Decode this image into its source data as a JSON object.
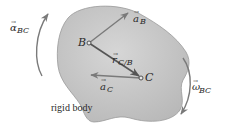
{
  "diagram": {
    "body_label": "rigid body",
    "points": [
      {
        "id": "B",
        "label": "B"
      },
      {
        "id": "C",
        "label": "C"
      }
    ],
    "vectors": {
      "a_B": {
        "symbol": "a",
        "subscript": "B",
        "arrow": "→"
      },
      "a_C": {
        "symbol": "a",
        "subscript": "C",
        "arrow": "→"
      },
      "r_CB": {
        "symbol": "r",
        "subscript": "C/B",
        "arrow": "→"
      }
    },
    "rotations": {
      "alpha": {
        "symbol": "α",
        "subscript": "BC",
        "arrow": "→",
        "direction": "counterclockwise"
      },
      "omega": {
        "symbol": "ω",
        "subscript": "BC",
        "arrow": "→",
        "direction": "clockwise"
      }
    },
    "colors": {
      "body_fill": "#c9c9c9",
      "body_edge": "#9a9a9a",
      "vector_dark": "#555555",
      "vector_light": "#8a8a8a",
      "text": "#2a2a2a"
    }
  }
}
